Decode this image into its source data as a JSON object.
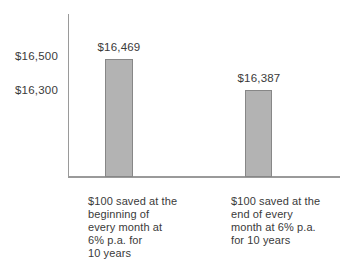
{
  "chart_data": {
    "type": "bar",
    "title": "",
    "xlabel": "",
    "ylabel": "",
    "categories": [
      "$100 saved at the beginning of every month at 6% p.a. for 10 years",
      "$100 saved at the end of every month at 6% p.a. for 10 years"
    ],
    "values": [
      16469,
      16387
    ],
    "data_labels": [
      "$16,469",
      "$16,387"
    ],
    "y_ticks": [
      16500,
      16300
    ],
    "y_tick_labels": [
      "$16,500",
      "$16,300"
    ],
    "grid": false,
    "legend": "none",
    "colors": {
      "bar_fill": "#b3b3b3",
      "bar_border": "#878787",
      "axis": "#9a9a9a",
      "text": "#3a3a3a",
      "background": "#ffffff"
    }
  },
  "y_axis": {
    "tick_labels": [
      "$16,500",
      "$16,300"
    ]
  },
  "bars": [
    {
      "value_label": "$16,469",
      "caption_lines": [
        "$100 saved at the",
        "beginning of",
        "every month at",
        "6% p.a. for",
        "10 years"
      ]
    },
    {
      "value_label": "$16,387",
      "caption_lines": [
        "$100 saved at the",
        "end of every",
        "month at 6% p.a.",
        "for 10 years"
      ]
    }
  ]
}
